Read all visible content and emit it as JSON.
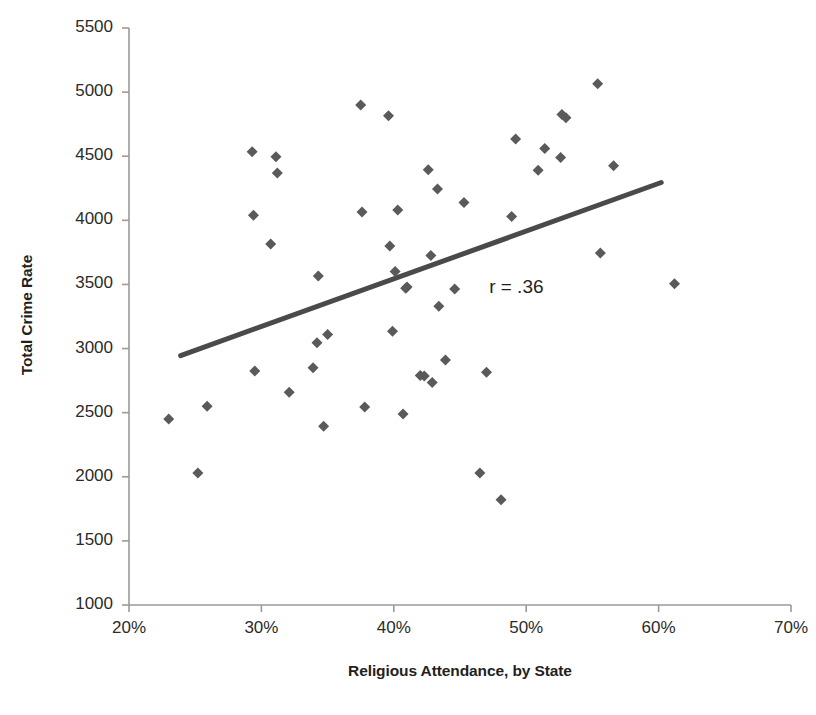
{
  "chart_data": {
    "type": "scatter",
    "title": "",
    "xlabel": "Religious Attendance, by State",
    "ylabel": "Total Crime Rate",
    "xlim": [
      20,
      70
    ],
    "ylim": [
      1000,
      5500
    ],
    "xtick_step": 10,
    "ytick_step": 500,
    "xticks": [
      "20%",
      "30%",
      "40%",
      "50%",
      "60%",
      "70%"
    ],
    "xtick_values": [
      20,
      30,
      40,
      50,
      60,
      70
    ],
    "yticks": [
      "1000",
      "1500",
      "2000",
      "2500",
      "3000",
      "3500",
      "4000",
      "4500",
      "5000",
      "5500"
    ],
    "ytick_values": [
      1000,
      1500,
      2000,
      2500,
      3000,
      3500,
      4000,
      4500,
      5000,
      5500
    ],
    "grid": false,
    "legend": null,
    "legend_position": "none",
    "marker": "diamond",
    "marker_color": "#5a5a5a",
    "marker_size": 11,
    "annotations": [
      {
        "text": "r = .36",
        "x": 47.2,
        "y": 3470
      }
    ],
    "trendline": {
      "type": "linear",
      "color": "#4a4a4a",
      "width": 5,
      "x_start": 23.9,
      "y_start": 2945,
      "x_end": 60.2,
      "y_end": 4295
    },
    "points": [
      {
        "x": 23.0,
        "y": 2450
      },
      {
        "x": 25.2,
        "y": 2030
      },
      {
        "x": 25.9,
        "y": 2550
      },
      {
        "x": 29.3,
        "y": 4535
      },
      {
        "x": 29.4,
        "y": 4040
      },
      {
        "x": 29.5,
        "y": 2825
      },
      {
        "x": 30.7,
        "y": 3815
      },
      {
        "x": 31.1,
        "y": 4495
      },
      {
        "x": 31.2,
        "y": 4370
      },
      {
        "x": 32.1,
        "y": 2660
      },
      {
        "x": 33.9,
        "y": 2850
      },
      {
        "x": 34.2,
        "y": 3045
      },
      {
        "x": 34.3,
        "y": 3565
      },
      {
        "x": 34.7,
        "y": 2395
      },
      {
        "x": 35.0,
        "y": 3110
      },
      {
        "x": 37.5,
        "y": 4900
      },
      {
        "x": 37.6,
        "y": 4065
      },
      {
        "x": 37.8,
        "y": 2545
      },
      {
        "x": 39.6,
        "y": 4815
      },
      {
        "x": 39.7,
        "y": 3800
      },
      {
        "x": 39.9,
        "y": 3135
      },
      {
        "x": 40.1,
        "y": 3600
      },
      {
        "x": 40.3,
        "y": 4080
      },
      {
        "x": 40.7,
        "y": 2490
      },
      {
        "x": 40.9,
        "y": 3470
      },
      {
        "x": 41.0,
        "y": 3480
      },
      {
        "x": 42.0,
        "y": 2790
      },
      {
        "x": 42.3,
        "y": 2785
      },
      {
        "x": 42.6,
        "y": 4395
      },
      {
        "x": 42.8,
        "y": 3725
      },
      {
        "x": 42.9,
        "y": 2735
      },
      {
        "x": 43.3,
        "y": 4245
      },
      {
        "x": 43.4,
        "y": 3330
      },
      {
        "x": 43.9,
        "y": 2910
      },
      {
        "x": 44.6,
        "y": 3465
      },
      {
        "x": 45.3,
        "y": 4140
      },
      {
        "x": 46.5,
        "y": 2030
      },
      {
        "x": 47.0,
        "y": 2815
      },
      {
        "x": 48.1,
        "y": 1820
      },
      {
        "x": 48.9,
        "y": 4030
      },
      {
        "x": 49.2,
        "y": 4635
      },
      {
        "x": 50.9,
        "y": 4390
      },
      {
        "x": 51.4,
        "y": 4560
      },
      {
        "x": 52.6,
        "y": 4490
      },
      {
        "x": 52.7,
        "y": 4825
      },
      {
        "x": 53.0,
        "y": 4800
      },
      {
        "x": 55.4,
        "y": 5065
      },
      {
        "x": 55.6,
        "y": 3745
      },
      {
        "x": 56.6,
        "y": 4425
      },
      {
        "x": 61.2,
        "y": 3505
      }
    ]
  },
  "style": {
    "axis_color": "#9a9a9a",
    "text_color": "#231f20",
    "background": "#ffffff"
  }
}
